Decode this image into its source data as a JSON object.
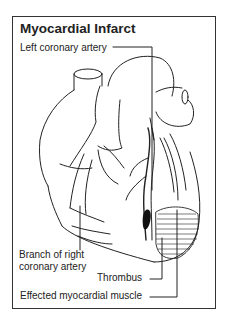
{
  "top_fragment": "Myocardial Infarct (partial heading above frame)",
  "diagram": {
    "title": "Myocardial Infarct",
    "labels": {
      "left_coronary_artery": "Left coronary artery",
      "branch_right_line1": "Branch of right",
      "branch_right_line2": "coronary artery",
      "thrombus": "Thrombus",
      "effected_muscle": "Effected myocardial muscle"
    },
    "colors": {
      "ink": "#222222",
      "frame": "#333333",
      "background": "#ffffff"
    }
  }
}
